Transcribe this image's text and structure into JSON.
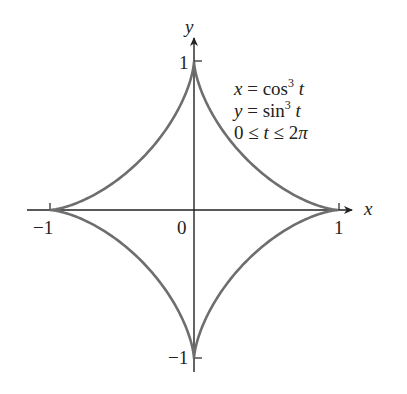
{
  "chart_data": {
    "type": "line",
    "xlabel": "x",
    "ylabel": "y",
    "xlim": [
      -1.15,
      1.1
    ],
    "ylim": [
      -1.15,
      1.15
    ],
    "grid": false,
    "x_ticks": [
      "-1",
      "0",
      "1"
    ],
    "y_ticks": [
      "1",
      "-1"
    ],
    "series": [
      {
        "name": "x = cos^3 t, y = sin^3 t",
        "parametric": {
          "x": "cos^3 t",
          "y": "sin^3 t",
          "t_range": [
            0,
            6.2832
          ]
        },
        "points": [
          [
            1,
            0
          ],
          [
            0.65,
            0.125
          ],
          [
            0.354,
            0.354
          ],
          [
            0.125,
            0.65
          ],
          [
            0,
            1
          ],
          [
            -0.125,
            0.65
          ],
          [
            -0.354,
            0.354
          ],
          [
            -0.65,
            0.125
          ],
          [
            -1,
            0
          ],
          [
            -0.65,
            -0.125
          ],
          [
            -0.354,
            -0.354
          ],
          [
            -0.125,
            -0.65
          ],
          [
            0,
            -1
          ],
          [
            0.125,
            -0.65
          ],
          [
            0.354,
            -0.354
          ],
          [
            0.65,
            -0.125
          ],
          [
            1,
            0
          ]
        ],
        "color": "#6e6e6e"
      }
    ],
    "annotations": [
      "x = cos³ t",
      "y = sin³ t",
      "0 ≤ t ≤ 2π"
    ]
  },
  "labels": {
    "x_axis": "x",
    "y_axis": "y",
    "tick_x_neg1": "−1",
    "tick_x_0": "0",
    "tick_x_1": "1",
    "tick_y_1": "1",
    "tick_y_neg1": "−1"
  },
  "equations": {
    "line1_lhs": "x",
    "line1_mid": " = cos",
    "line1_exp": "3",
    "line1_var": " t",
    "line2_lhs": "y",
    "line2_mid": " = sin",
    "line2_exp": "3",
    "line2_var": " t",
    "line3_a": "0 ≤ ",
    "line3_t": "t",
    "line3_b": " ≤ 2",
    "line3_pi": "π"
  },
  "colors": {
    "curve": "#6e6e6e",
    "axis": "#222222"
  }
}
